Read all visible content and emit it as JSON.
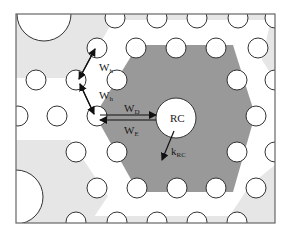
{
  "diagram": {
    "type": "photonic crystal lattice schematic",
    "frame": {
      "x": 16,
      "y": 14,
      "width": 259,
      "height": 209
    },
    "colors": {
      "background": "#ffffff",
      "light_region": "#e6e6e6",
      "dark_hexagon": "#999999",
      "hole_fill": "#ffffff",
      "hole_stroke": "#333333",
      "arrow": "#111111",
      "frame": "#666666"
    },
    "labels": {
      "wh_upper": "W",
      "wh_upper_sub": "h",
      "wh_lower": "W",
      "wh_lower_sub": "h",
      "wd": "W",
      "wd_sub": "D",
      "we": "W",
      "we_sub": "E",
      "rc": "RC",
      "krc": "k",
      "krc_sub": "RC"
    },
    "annotations": [
      {
        "id": "wh_upper",
        "meaning": "hopping coupling between adjacent holes (upper)"
      },
      {
        "id": "wh_lower",
        "meaning": "hopping coupling between adjacent holes (lower)"
      },
      {
        "id": "wd",
        "meaning": "coupling from waveguide hole to RC (drop)"
      },
      {
        "id": "we",
        "meaning": "coupling from RC back to waveguide hole"
      },
      {
        "id": "rc",
        "meaning": "large central resonant cavity"
      },
      {
        "id": "krc",
        "meaning": "RC loss / decay rate arrow"
      }
    ]
  }
}
